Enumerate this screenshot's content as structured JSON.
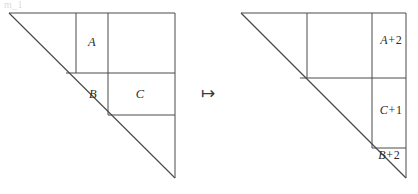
{
  "figure": {
    "width": 418,
    "height": 194,
    "background": "#ffffff",
    "line_color": "#4a4a4a",
    "text_color": "#2b2b2b",
    "ghost_text": "m_1",
    "mapsto_symbol": "↦"
  },
  "left_diagram": {
    "name": "source-triangle",
    "apex": [
      9,
      13
    ],
    "foot": [
      175,
      178
    ],
    "labels": [
      {
        "id": "A",
        "base": "A",
        "op": "",
        "num": "",
        "x": 92,
        "y": 42
      },
      {
        "id": "B",
        "base": "B",
        "op": "",
        "num": "",
        "x": 93,
        "y": 94
      },
      {
        "id": "C",
        "base": "C",
        "op": "",
        "num": "",
        "x": 140,
        "y": 94
      }
    ],
    "verticals_x": [
      76,
      108,
      175
    ],
    "horizontals_y": [
      13,
      73,
      115
    ]
  },
  "right_diagram": {
    "name": "target-triangle",
    "apex": [
      241,
      13
    ],
    "foot": [
      406,
      178
    ],
    "labels": [
      {
        "id": "A+2",
        "base": "A",
        "op": "+",
        "num": "2",
        "x": 391,
        "y": 40
      },
      {
        "id": "C+1",
        "base": "C",
        "op": "+",
        "num": "1",
        "x": 391,
        "y": 110
      },
      {
        "id": "B+2",
        "base": "B",
        "op": "+",
        "num": "2",
        "x": 389,
        "y": 155
      }
    ],
    "verticals_x": [
      307,
      372,
      406
    ],
    "horizontals_y": [
      13,
      78,
      148
    ]
  },
  "arrow": {
    "symbol": "↦",
    "x": 208,
    "y": 93
  }
}
